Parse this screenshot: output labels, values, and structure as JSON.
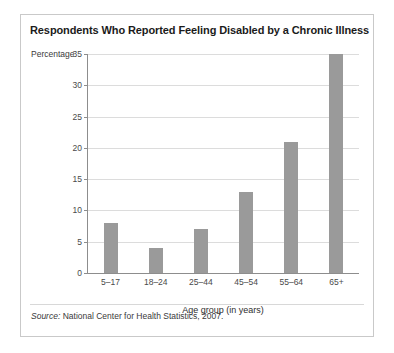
{
  "chart_data": {
    "type": "bar",
    "title": "Respondents Who Reported Feeling Disabled by a Chronic Illness",
    "categories": [
      "5–17",
      "18–24",
      "25–44",
      "45–54",
      "55–64",
      "65+"
    ],
    "values": [
      8,
      4,
      7,
      13,
      21,
      35
    ],
    "xlabel": "Age group (in years)",
    "ylabel": "Percentage",
    "ylim": [
      0,
      35
    ],
    "ytick_labels": [
      "35",
      "30",
      "25",
      "20",
      "15",
      "10",
      "5",
      "0"
    ],
    "ytick_values": [
      35,
      30,
      25,
      20,
      15,
      10,
      5,
      0
    ],
    "grid": true,
    "legend": null,
    "bar_color": "#9a9a9a",
    "grid_color": "#dcdcdc",
    "axis_color": "#8d8d8d"
  },
  "footer": {
    "source_word": "Source:",
    "source_text": " National Center for Health Statistics, 2007."
  }
}
